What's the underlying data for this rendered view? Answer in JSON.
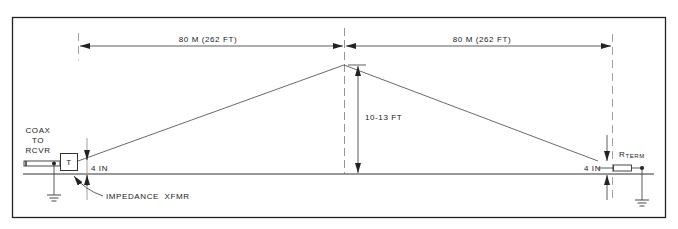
{
  "diagram": {
    "type": "beverage-antenna-schematic",
    "dimensions": {
      "left_span": "80 M (262 FT)",
      "right_span": "80 M (262 FT)",
      "mast_height": "10-13 FT",
      "left_feed_height": "4 IN",
      "right_feed_height": "4 IN"
    },
    "labels": {
      "coax_line1": "COAX",
      "coax_line2": "TO",
      "coax_line3": "RCVR",
      "transformer_symbol": "T",
      "transformer_callout": "IMPEDANCE  XFMR",
      "resistor_main": "R",
      "resistor_sub": "TERM"
    },
    "colors": {
      "line": "#333333",
      "frame": "#222222",
      "background": "#ffffff"
    }
  }
}
